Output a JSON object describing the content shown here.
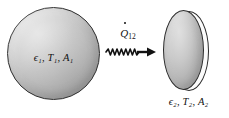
{
  "figure": {
    "background_color": "#ffffff",
    "outline_color": "#2b2b2b"
  },
  "body1": {
    "shape": "sphere",
    "name": "surface-1",
    "label": "ϵ₁, T₁, A₁",
    "properties": [
      {
        "symbol": "ϵ₁",
        "meaning": "emissivity"
      },
      {
        "symbol": "T₁",
        "meaning": "temperature"
      },
      {
        "symbol": "A₁",
        "meaning": "area"
      }
    ],
    "fill_light": "#e4e4e4",
    "fill_dark": "#9c9c9c"
  },
  "body2": {
    "shape": "disk",
    "name": "surface-2",
    "label": "ϵ₂, T₂, A₂",
    "properties": [
      {
        "symbol": "ϵ₂",
        "meaning": "emissivity"
      },
      {
        "symbol": "T₂",
        "meaning": "temperature"
      },
      {
        "symbol": "A₂",
        "meaning": "area"
      }
    ],
    "fill_light": "#e0e0e0",
    "fill_dark": "#9a9a9a"
  },
  "heat_flux": {
    "symbol": "Q",
    "subscript": "12",
    "label": "Q̇12",
    "direction": "right",
    "arrow_style": "wavy",
    "wave_count": 8,
    "color": "#111111"
  }
}
